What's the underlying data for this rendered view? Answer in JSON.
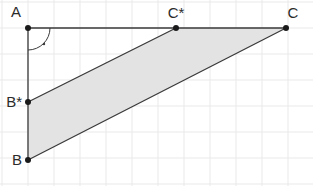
{
  "figure": {
    "width": 313,
    "height": 186,
    "background_color": "#ffffff"
  },
  "grid": {
    "cell_size": 26,
    "origin_x": 28,
    "origin_y": 28,
    "line_color": "#e9e9e9",
    "line_width": 1,
    "x_lines": [
      2,
      28,
      54,
      80,
      106,
      132,
      158,
      184,
      210,
      236,
      262,
      288
    ],
    "y_lines": [
      2,
      28,
      54,
      80,
      106,
      132,
      158,
      184
    ]
  },
  "style": {
    "stroke_color": "#3a3a3a",
    "stroke_width": 1.3,
    "fill_color": "#e3e3e3",
    "fill_opacity": 1,
    "point_color": "#1a1a1a",
    "point_radius": 3,
    "label_color": "#2b2b2b",
    "label_font_size": 15
  },
  "points": [
    {
      "name": "A",
      "label": "A",
      "x": 28,
      "y": 28,
      "label_x": 16,
      "label_y": 17,
      "label_anchor": "middle"
    },
    {
      "name": "Bstar",
      "label": "B*",
      "x": 28,
      "y": 102,
      "label_x": 22,
      "label_y": 107,
      "label_anchor": "end"
    },
    {
      "name": "B",
      "label": "B",
      "x": 28,
      "y": 160,
      "label_x": 22,
      "label_y": 165,
      "label_anchor": "end"
    },
    {
      "name": "Cstar",
      "label": "C*",
      "x": 176,
      "y": 28,
      "label_x": 176,
      "label_y": 18,
      "label_anchor": "middle"
    },
    {
      "name": "C",
      "label": "C",
      "x": 286,
      "y": 28,
      "label_x": 293,
      "label_y": 18,
      "label_anchor": "middle"
    }
  ],
  "segments": [
    {
      "name": "segment-A-C",
      "x1": 28,
      "y1": 28,
      "x2": 286,
      "y2": 28
    },
    {
      "name": "segment-A-B",
      "x1": 28,
      "y1": 28,
      "x2": 28,
      "y2": 160
    },
    {
      "name": "segment-B-C",
      "x1": 28,
      "y1": 160,
      "x2": 286,
      "y2": 28
    },
    {
      "name": "segment-Bstar-Cstar",
      "x1": 28,
      "y1": 102,
      "x2": 176,
      "y2": 28
    }
  ],
  "shaded_region": {
    "name": "parallelogram-Bstar-Cstar-C-B",
    "vertices": "28,102 176,28 286,28 28,160",
    "description": "Shaded parallelogram B* C* C B"
  },
  "right_angle": {
    "name": "right-angle-at-A",
    "vertex_x": 28,
    "vertex_y": 28,
    "radius": 22,
    "arc_path": "M 50 28 A 22 22 0 0 1 28 50",
    "dot_x": 44,
    "dot_y": 44,
    "dot_radius": 1.2
  }
}
